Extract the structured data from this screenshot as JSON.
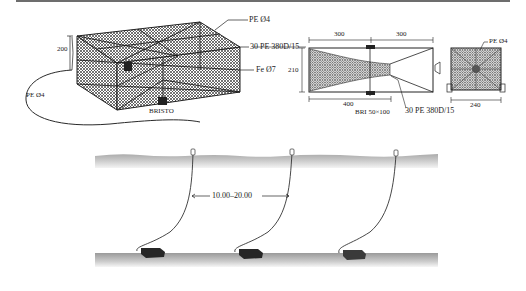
{
  "figure": {
    "isometric_pot": {
      "labels": {
        "top_rope": "PE Ø4",
        "netting": "30 PE 380D/15",
        "frame": "Fe Ø7",
        "height_dim": "200",
        "buoy_line": "PE Ø4",
        "entrance": "BRISTO"
      }
    },
    "side_view": {
      "labels": {
        "dim_left": "300",
        "dim_right": "300",
        "height_dim": "210",
        "funnel_length": "400",
        "entrance": "BRI 50×100",
        "netting": "30 PE 380D/15"
      }
    },
    "end_view": {
      "labels": {
        "rope": "PE Ø4",
        "width_dim": "240"
      }
    },
    "deployment": {
      "spacing_label": "10.00–20.00",
      "pot_count": 3
    }
  },
  "colors": {
    "line": "#2a2a2a",
    "mesh": "#555555",
    "water": "#b5b5b5",
    "seafloor": "#a8a8a8",
    "pot": "#2b2b2b",
    "header_rule": "#6d6d6d"
  }
}
